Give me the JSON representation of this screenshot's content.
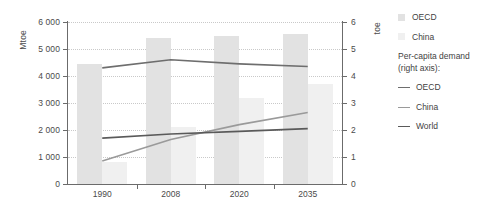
{
  "chart_data": {
    "type": "bar",
    "title": "",
    "subtitle": "",
    "categories": [
      "1990",
      "2008",
      "2020",
      "2035"
    ],
    "xlabel": "",
    "ylabel": "Mtoe",
    "ylabel_right": "toe",
    "ylim": [
      0,
      6000
    ],
    "ylim_right": [
      0,
      6
    ],
    "yticks": [
      "0",
      "1 000",
      "2 000",
      "3 000",
      "4 000",
      "5 000",
      "6 000"
    ],
    "ytick_values": [
      0,
      1000,
      2000,
      3000,
      4000,
      5000,
      6000
    ],
    "yticks_right": [
      "0",
      "1",
      "2",
      "3",
      "4",
      "5",
      "6"
    ],
    "ytick_values_right": [
      0,
      1,
      2,
      3,
      4,
      5,
      6
    ],
    "grid": true,
    "legend_position": "right",
    "series": [
      {
        "name": "OECD",
        "kind": "bar",
        "axis": "left",
        "color": "#e2e2e2",
        "values": [
          4450,
          5400,
          5500,
          5550
        ]
      },
      {
        "name": "China",
        "kind": "bar",
        "axis": "left",
        "color": "#f0f0f0",
        "values": [
          800,
          2100,
          3200,
          3700
        ]
      },
      {
        "name": "OECD",
        "kind": "line",
        "axis": "right",
        "color": "#6e6e6e",
        "values": [
          4.3,
          4.6,
          4.45,
          4.35
        ]
      },
      {
        "name": "China",
        "kind": "line",
        "axis": "right",
        "color": "#9a9a9a",
        "values": [
          0.85,
          1.65,
          2.2,
          2.65
        ]
      },
      {
        "name": "World",
        "kind": "line",
        "axis": "right",
        "color": "#5a5a5a",
        "values": [
          1.7,
          1.85,
          1.95,
          2.05
        ]
      }
    ]
  },
  "legend": {
    "bars": [
      {
        "label": "OECD",
        "swatch": "oecd"
      },
      {
        "label": "China",
        "swatch": "china"
      }
    ],
    "group_title_line1": "Per-capita demand",
    "group_title_line2": "(right axis):",
    "lines": [
      {
        "label": "OECD",
        "color": "#6e6e6e"
      },
      {
        "label": "China",
        "color": "#9a9a9a"
      },
      {
        "label": "World",
        "color": "#5a5a5a"
      }
    ]
  },
  "axes": {
    "left_title": "Mtoe",
    "right_title": "toe"
  }
}
